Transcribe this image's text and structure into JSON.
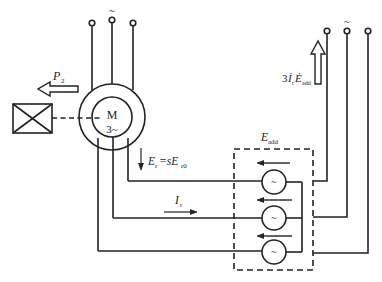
{
  "diagram": {
    "type": "circuit-schematic",
    "colors": {
      "line": "#222222",
      "background": "#ffffff"
    },
    "motor": {
      "symbol": "M",
      "phase": "3~"
    },
    "labels": {
      "output_power": "P",
      "output_power_sub": "2",
      "supply_tilde_left": "~",
      "supply_tilde_right": "~",
      "rotor_emf_main": "E",
      "rotor_emf_sub": "r",
      "rotor_emf_eq": "=sE",
      "rotor_emf_sub2": "r0",
      "rotor_current_main": "I",
      "rotor_current_sub": "r",
      "added_emf_main": "E",
      "added_emf_sub": "add",
      "feedback_power_prefix": "3",
      "feedback_power_i": "İ",
      "feedback_power_i_sub": "r",
      "feedback_power_e": "Ė",
      "feedback_power_e_sub": "add",
      "source_symbol": "~"
    },
    "components": [
      "three-phase supply terminals (left)",
      "induction motor M 3~",
      "mechanical load",
      "additional EMF sources (3)",
      "three-phase supply terminals (right)"
    ]
  }
}
